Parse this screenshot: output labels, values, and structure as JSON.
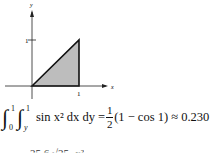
{
  "figure": {
    "axes": {
      "x_label": "x",
      "y_label": "y"
    },
    "ticks": {
      "x_tick": "1",
      "y_tick": "1"
    },
    "region": {
      "shape": "triangle",
      "vertices": [
        [
          0,
          0
        ],
        [
          1,
          1
        ],
        [
          1,
          0
        ]
      ],
      "fill": "#bdbdbd"
    }
  },
  "equation": {
    "int1_lower": "0",
    "int1_upper": "1",
    "int2_lower": "y",
    "int2_upper": "1",
    "integrand": "sin x² dx dy =",
    "frac_num": "1",
    "frac_den": "2",
    "rest": "(1 − cos 1) ≈ 0.230"
  },
  "cutoff_line": "25 6 √25−x²"
}
